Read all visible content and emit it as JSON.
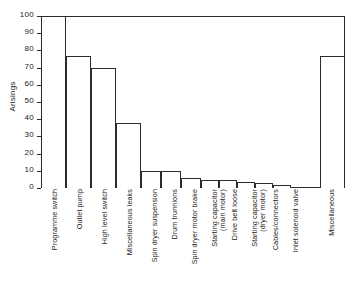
{
  "chart_data": {
    "type": "bar",
    "title": "",
    "subtitle": "",
    "xlabel": "",
    "ylabel": "Arisings",
    "ylim": [
      0,
      100
    ],
    "ytick_values": [
      0,
      10,
      20,
      30,
      40,
      50,
      60,
      70,
      80,
      90,
      100
    ],
    "ytick_labels": [
      "0",
      "10",
      "20",
      "30",
      "40",
      "50",
      "60",
      "70",
      "80",
      "90",
      "100"
    ],
    "grid": false,
    "legend": false,
    "legend_position": "none",
    "bar_style": {
      "fill": "#ffffff",
      "edge": "#2b2b2b",
      "contiguous": true,
      "note": "Bars abut each other; a gap separates the final 'Miscellaneous' bar"
    },
    "categories": [
      "Programme switch",
      "Outlet pump",
      "High level switch",
      "Miscellaneous leaks",
      "Spin dryer suspension",
      "Drum trunnions",
      "Spin dryer motor brake",
      "Starting capacitor (main motor)",
      "Drive belt loose",
      "Starting capacitor (dryer motor)",
      "Cables/connectors",
      "Inlet solenoid valve",
      "Miscellaneous"
    ],
    "category_lines": [
      [
        "Programme switch"
      ],
      [
        "Outlet pump"
      ],
      [
        "High level switch"
      ],
      [
        "Miscellaneous leaks"
      ],
      [
        "Spin dryer suspension"
      ],
      [
        "Drum trunnions"
      ],
      [
        "Spin dryer motor brake"
      ],
      [
        "Starting capacitor",
        "(main motor)"
      ],
      [
        "Drive belt loose"
      ],
      [
        "Starting capacitor",
        "(dryer motor)"
      ],
      [
        "Cables/connectors"
      ],
      [
        "Inlet solenoid valve"
      ],
      [
        "Miscellaneous"
      ]
    ],
    "values": [
      100,
      77,
      70,
      38,
      10,
      10,
      6,
      4.5,
      4.5,
      3.5,
      3,
      2,
      77
    ],
    "series": [
      {
        "name": "Arisings",
        "values": [
          100,
          77,
          70,
          38,
          10,
          10,
          6,
          4.5,
          4.5,
          3.5,
          3,
          2,
          77
        ]
      }
    ]
  },
  "geometry": {
    "bar_left_pct": [
      0.0,
      8.22,
      16.45,
      24.67,
      32.89,
      39.47,
      46.05,
      52.63,
      58.55,
      64.47,
      70.39,
      76.32,
      91.78
    ],
    "bar_width_pct": [
      8.22,
      8.22,
      8.22,
      8.22,
      6.58,
      6.58,
      6.58,
      5.92,
      5.92,
      5.92,
      5.92,
      5.92,
      8.22
    ],
    "label_left_px": [
      10,
      35,
      60,
      85,
      110,
      130,
      150,
      170,
      190,
      210,
      231,
      251,
      287
    ]
  }
}
